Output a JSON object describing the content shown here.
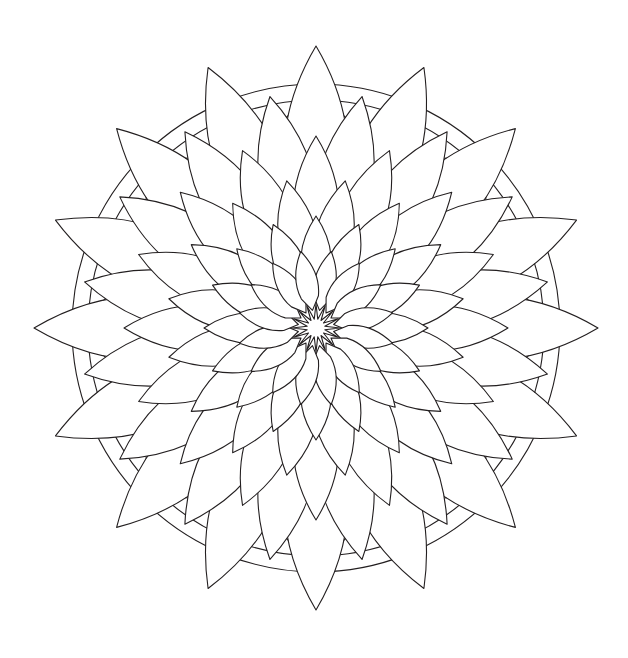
{
  "page": {
    "kind": "line-art-coloring-page",
    "width": 628,
    "height": 658,
    "background_color": "#ffffff",
    "stroke_color": "#231f20",
    "fill_color": "none",
    "stroke_width": 1.1
  },
  "artwork": {
    "name": "flower-mandala",
    "description": "Symmetrical radial flower mandala of overlapping pointed leaf petals over concentric circles and interlaced arcs",
    "center_x": 316,
    "center_y": 328,
    "symmetry": 16,
    "outer_radius": 282,
    "circles": [
      {
        "name": "outer-circle",
        "radius": 244
      },
      {
        "name": "inner-circle",
        "radius": 228
      },
      {
        "name": "mid-circle",
        "radius": 176
      }
    ],
    "interlace": {
      "name": "interlaced-arc-band",
      "count": 8,
      "chord_radius": 238,
      "bulge": 62
    },
    "petal_rings": [
      {
        "name": "ring-1-outer",
        "count": 16,
        "inner_radius": 86,
        "outer_radius": 282,
        "half_width": 42,
        "waist": 0.52,
        "notch": 0.2,
        "phase_deg": 0
      },
      {
        "name": "ring-2",
        "count": 16,
        "inner_radius": 72,
        "outer_radius": 236,
        "half_width": 36,
        "waist": 0.52,
        "notch": 0.2,
        "phase_deg": 11.25
      },
      {
        "name": "ring-3",
        "count": 16,
        "inner_radius": 58,
        "outer_radius": 192,
        "half_width": 30,
        "waist": 0.52,
        "notch": 0.2,
        "phase_deg": 0
      },
      {
        "name": "ring-4",
        "count": 16,
        "inner_radius": 44,
        "outer_radius": 150,
        "half_width": 25,
        "waist": 0.52,
        "notch": 0.2,
        "phase_deg": 11.25
      },
      {
        "name": "ring-5",
        "count": 16,
        "inner_radius": 30,
        "outer_radius": 112,
        "half_width": 20,
        "waist": 0.52,
        "notch": 0.2,
        "phase_deg": 0
      },
      {
        "name": "ring-6-inner",
        "count": 16,
        "inner_radius": 18,
        "outer_radius": 78,
        "half_width": 14,
        "waist": 0.52,
        "notch": 0.22,
        "phase_deg": 11.25
      }
    ],
    "center_star": {
      "name": "center-star",
      "points": 16,
      "inner_radius": 9,
      "outer_radius": 24
    }
  }
}
